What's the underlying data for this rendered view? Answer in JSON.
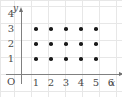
{
  "chart_data": {
    "type": "scatter",
    "title": "",
    "subtitle": "",
    "xlabel": "x",
    "ylabel": "y",
    "origin_label": "O",
    "grid": true,
    "legend": null,
    "xlim": [
      0,
      6.6
    ],
    "ylim": [
      0,
      4.6
    ],
    "xticks": [
      1,
      2,
      3,
      4,
      5,
      6
    ],
    "yticks": [
      1,
      2,
      3,
      4
    ],
    "xtick_labels": [
      "1",
      "2",
      "3",
      "4",
      "5",
      "6"
    ],
    "ytick_labels": [
      "1",
      "2",
      "3",
      "4"
    ],
    "point_count": 15,
    "marker_color": "#1a1a1a",
    "axis_color": "#808080",
    "grid_color": "#e7e7e7",
    "points": [
      {
        "x": 1,
        "y": 1
      },
      {
        "x": 2,
        "y": 1
      },
      {
        "x": 3,
        "y": 1
      },
      {
        "x": 4,
        "y": 1
      },
      {
        "x": 5,
        "y": 1
      },
      {
        "x": 1,
        "y": 2
      },
      {
        "x": 2,
        "y": 2
      },
      {
        "x": 3,
        "y": 2
      },
      {
        "x": 4,
        "y": 2
      },
      {
        "x": 5,
        "y": 2
      },
      {
        "x": 1,
        "y": 3
      },
      {
        "x": 2,
        "y": 3
      },
      {
        "x": 3,
        "y": 3
      },
      {
        "x": 4,
        "y": 3
      },
      {
        "x": 5,
        "y": 3
      }
    ],
    "background_grid": {
      "vertical_positions": [
        0,
        14,
        31,
        48,
        65,
        82,
        99,
        116
      ],
      "horizontal_positions": [
        0,
        6,
        23,
        40,
        57,
        74,
        91
      ]
    }
  },
  "geometry": {
    "origin_px_x": 21,
    "origin_px_y": 74,
    "unit_px_x": 15,
    "unit_px_y": 15
  }
}
